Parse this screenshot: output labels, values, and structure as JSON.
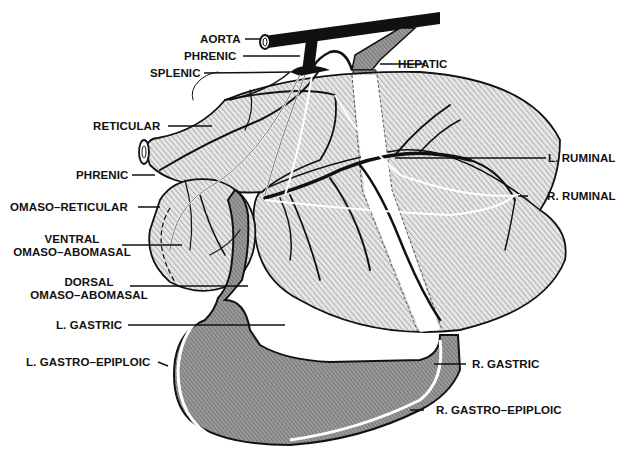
{
  "diagram": {
    "type": "anatomical-illustration",
    "colors": {
      "ink": "#111111",
      "rumen_hatch_bg": "#d9d9d9",
      "abomasum_fill": "#8c8c8c",
      "background": "#ffffff"
    },
    "labels": {
      "aorta": "AORTA",
      "phrenic_top": "PHRENIC",
      "splenic": "SPLENIC",
      "hepatic": "HEPATIC",
      "reticular": "RETICULAR",
      "l_ruminal": "L. RUMINAL",
      "phrenic_left": "PHRENIC",
      "r_ruminal": "R. RUMINAL",
      "omaso_reticular": "OMASO–RETICULAR",
      "ventral_line1": "VENTRAL",
      "ventral_line2": "OMASO–ABOMASAL",
      "dorsal_line1": "DORSAL",
      "dorsal_line2": "OMASO–ABOMASAL",
      "l_gastric": "L. GASTRIC",
      "l_gastro_epiploic": "L. GASTRO–EPIPLOIC",
      "r_gastric": "R. GASTRIC",
      "r_gastro_epiploic": "R. GASTRO–EPIPLOIC"
    }
  }
}
